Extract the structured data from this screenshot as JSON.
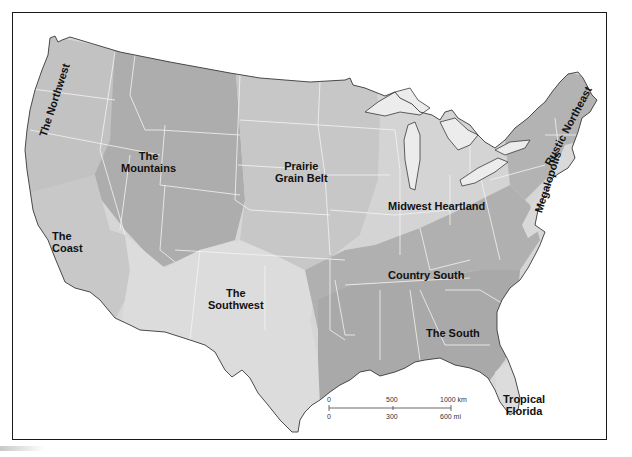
{
  "map": {
    "title": "",
    "subject": "Cultural/economic regions of the contiguous United States",
    "colors": {
      "frame": "#1a1a1a",
      "background": "#ffffff",
      "land_light": "#d9d9d9",
      "land_mid": "#c4c4c4",
      "land_dark": "#a9a9a9",
      "state_borders": "#f2f2f2",
      "water": "#ffffff",
      "coastline": "#3a3a3a",
      "label_text": "#111111"
    },
    "regions": [
      {
        "id": "northwest",
        "label": "The Northwest",
        "rotated": true
      },
      {
        "id": "mountains",
        "label_line1": "The",
        "label_line2": "Mountains"
      },
      {
        "id": "prairie",
        "label_line1": "Prairie",
        "label_line2": "Grain Belt"
      },
      {
        "id": "midwest",
        "label": "Midwest Heartland"
      },
      {
        "id": "rustic-northeast",
        "label": "Rustic Northeast",
        "rotated": true
      },
      {
        "id": "megalopolis",
        "label": "Megalopolis",
        "rotated": true
      },
      {
        "id": "coast",
        "label_line1": "The",
        "label_line2": "Coast"
      },
      {
        "id": "southwest",
        "label_line1": "The",
        "label_line2": "Southwest"
      },
      {
        "id": "country-south",
        "label": "Country South"
      },
      {
        "id": "south",
        "label": "The South"
      },
      {
        "id": "tropical-florida",
        "label_line1": "Tropical",
        "label_line2": "Florida"
      }
    ],
    "scale_bar": {
      "km_labels": [
        "0",
        "500",
        "1000 km"
      ],
      "mi_labels": [
        "0",
        "300",
        "600 mi"
      ]
    }
  }
}
